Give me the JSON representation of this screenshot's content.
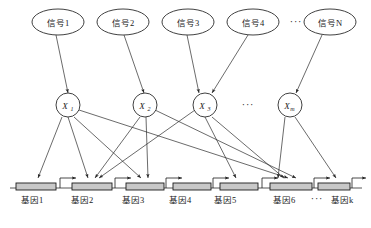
{
  "diagram": {
    "colors": {
      "stroke": "#2b2b2b",
      "gene_fill": "#c8c8c8",
      "background": "#ffffff"
    },
    "ellipsis": "···",
    "signals": [
      {
        "label": "信号1",
        "cx": 58,
        "cy": 22
      },
      {
        "label": "信号2",
        "cx": 123,
        "cy": 22
      },
      {
        "label": "信号3",
        "cx": 188,
        "cy": 22
      },
      {
        "label": "信号4",
        "cx": 253,
        "cy": 22
      },
      {
        "label": "信号N",
        "cx": 330,
        "cy": 22
      }
    ],
    "signal_row_ellipsis": {
      "text": "···",
      "x": 296,
      "y": 25
    },
    "factors": [
      {
        "label": "X",
        "sub": "1",
        "cx": 68,
        "cy": 105
      },
      {
        "label": "X",
        "sub": "2",
        "cx": 145,
        "cy": 105
      },
      {
        "label": "X",
        "sub": "3",
        "cx": 205,
        "cy": 105
      },
      {
        "label": "X",
        "sub": "m",
        "cx": 290,
        "cy": 105
      }
    ],
    "factor_row_ellipsis": {
      "text": "···",
      "x": 248,
      "y": 108
    },
    "genes": [
      {
        "label": "基因1",
        "x": 32,
        "y": 196
      },
      {
        "label": "基因2",
        "x": 82,
        "y": 196
      },
      {
        "label": "基因3",
        "x": 133,
        "y": 196
      },
      {
        "label": "基因4",
        "x": 180,
        "y": 196
      },
      {
        "label": "基因5",
        "x": 225,
        "y": 196
      },
      {
        "label": "基因6",
        "x": 284,
        "y": 196
      },
      {
        "label": "基因k",
        "x": 342,
        "y": 196
      }
    ],
    "gene_row_ellipsis": {
      "text": "···",
      "x": 318,
      "y": 199
    },
    "gene_boxes": [
      {
        "cx": 36,
        "cy": 184
      },
      {
        "cx": 92,
        "cy": 184
      },
      {
        "cx": 145,
        "cy": 184
      },
      {
        "cx": 192,
        "cy": 184
      },
      {
        "cx": 239,
        "cy": 184
      },
      {
        "cx": 292,
        "cy": 184
      },
      {
        "cx": 338,
        "cy": 184
      }
    ],
    "signal_to_factor_edges": [
      {
        "from": "信号1",
        "to": "X1"
      },
      {
        "from": "信号2",
        "to": "X2"
      },
      {
        "from": "信号3",
        "to": "X3"
      },
      {
        "from": "信号4",
        "to": "X3"
      },
      {
        "from": "信号N",
        "to": "Xm"
      }
    ],
    "factor_to_gene_edges": [
      {
        "from": "X1",
        "to": "基因1"
      },
      {
        "from": "X1",
        "to": "基因2"
      },
      {
        "from": "X1",
        "to": "基因3"
      },
      {
        "from": "X1",
        "to": "基因6"
      },
      {
        "from": "X2",
        "to": "基因2"
      },
      {
        "from": "X2",
        "to": "基因3"
      },
      {
        "from": "X2",
        "to": "基因6"
      },
      {
        "from": "X3",
        "to": "基因2"
      },
      {
        "from": "X3",
        "to": "基因5"
      },
      {
        "from": "X3",
        "to": "基因6"
      },
      {
        "from": "Xm",
        "to": "基因6"
      },
      {
        "from": "Xm",
        "to": "基因k"
      }
    ]
  }
}
